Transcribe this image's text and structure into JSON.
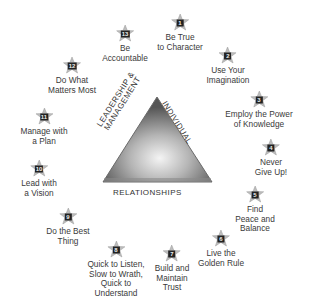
{
  "diagram": {
    "center": {
      "sides": {
        "left": [
          "LEADERSHIP &",
          "MANAGEMENT"
        ],
        "right": "INDIVIDUAL",
        "bottom": "RELATIONSHIPS"
      },
      "colors": {
        "dark": "#5a5a5a",
        "light": "#f2f2f2",
        "edge": "#6e6e6e"
      }
    },
    "items": [
      {
        "number": "1",
        "lines": [
          "Be True",
          "to Character"
        ],
        "x": 180,
        "y": 14
      },
      {
        "number": "2",
        "lines": [
          "Use Your",
          "Imagination"
        ],
        "x": 228,
        "y": 47
      },
      {
        "number": "3",
        "lines": [
          "Employ the Power",
          "of Knowledge"
        ],
        "x": 259,
        "y": 91
      },
      {
        "number": "4",
        "lines": [
          "Never",
          "Give Up!"
        ],
        "x": 271,
        "y": 139
      },
      {
        "number": "5",
        "lines": [
          "Find",
          "Peace and",
          "Balance"
        ],
        "x": 255,
        "y": 186
      },
      {
        "number": "6",
        "lines": [
          "Live the",
          "Golden Rule"
        ],
        "x": 221,
        "y": 230
      },
      {
        "number": "7",
        "lines": [
          "Build and",
          "Maintain",
          "Trust"
        ],
        "x": 172,
        "y": 245
      },
      {
        "number": "8",
        "lines": [
          "Quick to Listen,",
          "Slow to Wrath,",
          "Quick to",
          "Understand"
        ],
        "x": 116,
        "y": 241
      },
      {
        "number": "9",
        "lines": [
          "Do the Best",
          "Thing"
        ],
        "x": 68,
        "y": 208
      },
      {
        "number": "10",
        "lines": [
          "Lead with",
          "a Vision"
        ],
        "x": 39,
        "y": 160
      },
      {
        "number": "11",
        "lines": [
          "Manage with",
          "a Plan"
        ],
        "x": 44,
        "y": 108
      },
      {
        "number": "12",
        "lines": [
          "Do What",
          "Matters Most"
        ],
        "x": 72,
        "y": 57
      },
      {
        "number": "13",
        "lines": [
          "Be",
          "Accountable"
        ],
        "x": 125,
        "y": 25
      }
    ]
  }
}
